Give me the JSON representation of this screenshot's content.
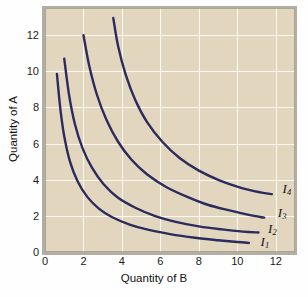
{
  "figure": {
    "background_color": "#fefefe",
    "plot_background_color": "#e3d6bf",
    "gridline_color": "#fdfaf2",
    "curve_color": "#2b2b5e",
    "border_color": "#b2aea4"
  },
  "chart_data": {
    "type": "line",
    "title": "",
    "subtitle": "",
    "xlabel": "Quantity of B",
    "ylabel": "Quantity of A",
    "xlim": [
      0,
      13
    ],
    "ylim": [
      0,
      13.5
    ],
    "xticks": [
      0,
      2,
      4,
      6,
      8,
      10,
      12
    ],
    "xtick_labels": [
      "0",
      "2",
      "4",
      "6",
      "8",
      "10",
      "12"
    ],
    "yticks": [
      0,
      2,
      4,
      6,
      8,
      10,
      12
    ],
    "ytick_labels": [
      "0",
      "2",
      "4",
      "6",
      "8",
      "10",
      "12"
    ],
    "grid": true,
    "legend": "inline-end-labels",
    "series": [
      {
        "name": "I1",
        "label": "I",
        "subscript": "1",
        "annotation_x": 11.2,
        "annotation_y": 0.55,
        "x": [
          0.62,
          0.8,
          1.0,
          1.3,
          1.7,
          2.2,
          2.8,
          3.5,
          4.4,
          5.4,
          6.5,
          7.8,
          9.0,
          10.0,
          10.6
        ],
        "y": [
          9.85,
          7.9,
          6.4,
          5.0,
          3.9,
          3.05,
          2.4,
          1.92,
          1.52,
          1.22,
          0.99,
          0.79,
          0.65,
          0.55,
          0.5
        ]
      },
      {
        "name": "I2",
        "label": "I",
        "subscript": "2",
        "annotation_x": 11.6,
        "annotation_y": 1.3,
        "x": [
          1.0,
          1.25,
          1.55,
          1.95,
          2.45,
          3.05,
          3.8,
          4.7,
          5.7,
          6.8,
          8.0,
          9.2,
          10.3,
          11.1
        ],
        "y": [
          10.7,
          8.7,
          7.1,
          5.75,
          4.65,
          3.75,
          3.0,
          2.45,
          2.0,
          1.67,
          1.42,
          1.25,
          1.13,
          1.08
        ]
      },
      {
        "name": "I3",
        "label": "I",
        "subscript": "3",
        "annotation_x": 12.1,
        "annotation_y": 2.15,
        "x": [
          2.0,
          2.3,
          2.7,
          3.2,
          3.8,
          4.5,
          5.3,
          6.3,
          7.4,
          8.5,
          9.6,
          10.6,
          11.4
        ],
        "y": [
          12.0,
          10.3,
          8.7,
          7.3,
          6.1,
          5.1,
          4.3,
          3.6,
          3.05,
          2.6,
          2.3,
          2.05,
          1.9
        ]
      },
      {
        "name": "I4",
        "label": "I",
        "subscript": "4",
        "annotation_x": 12.35,
        "annotation_y": 3.5,
        "x": [
          3.55,
          3.8,
          4.2,
          4.7,
          5.3,
          6.1,
          7.0,
          8.0,
          9.1,
          10.2,
          11.2,
          11.8
        ],
        "y": [
          12.95,
          11.4,
          9.8,
          8.4,
          7.2,
          6.1,
          5.2,
          4.5,
          3.95,
          3.55,
          3.3,
          3.2
        ]
      }
    ]
  }
}
